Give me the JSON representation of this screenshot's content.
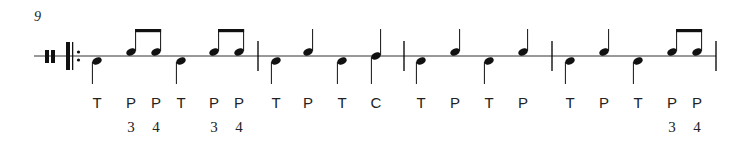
{
  "score": {
    "measure_number": "9",
    "staff_line_y": 56,
    "clef": "percussion",
    "start_repeat": true,
    "color": "#111111",
    "barlines_x": [
      258,
      404,
      552,
      716
    ],
    "notes": [
      {
        "measure": 1,
        "x": 97,
        "type": "T",
        "position": "below",
        "stem": "down",
        "beam": null,
        "label": "T",
        "fingering": ""
      },
      {
        "measure": 1,
        "x": 131,
        "type": "P",
        "position": "above",
        "stem": "up",
        "beam": "start",
        "label": "P",
        "fingering": "3"
      },
      {
        "measure": 1,
        "x": 156,
        "type": "P",
        "position": "above",
        "stem": "up",
        "beam": "end",
        "label": "P",
        "fingering": "4"
      },
      {
        "measure": 1,
        "x": 181,
        "type": "T",
        "position": "below",
        "stem": "down",
        "beam": null,
        "label": "T",
        "fingering": ""
      },
      {
        "measure": 1,
        "x": 214,
        "type": "P",
        "position": "above",
        "stem": "up",
        "beam": "start",
        "label": "P",
        "fingering": "3"
      },
      {
        "measure": 1,
        "x": 239,
        "type": "P",
        "position": "above",
        "stem": "up",
        "beam": "end",
        "label": "P",
        "fingering": "4"
      },
      {
        "measure": 2,
        "x": 276,
        "type": "T",
        "position": "below",
        "stem": "down",
        "beam": null,
        "label": "T",
        "fingering": ""
      },
      {
        "measure": 2,
        "x": 308,
        "type": "P",
        "position": "above",
        "stem": "up",
        "beam": null,
        "label": "P",
        "fingering": ""
      },
      {
        "measure": 2,
        "x": 342,
        "type": "T",
        "position": "below",
        "stem": "down",
        "beam": null,
        "label": "T",
        "fingering": ""
      },
      {
        "measure": 2,
        "x": 376,
        "type": "C",
        "position": "on",
        "stem": "both",
        "beam": null,
        "label": "C",
        "fingering": ""
      },
      {
        "measure": 3,
        "x": 421,
        "type": "T",
        "position": "below",
        "stem": "down",
        "beam": null,
        "label": "T",
        "fingering": ""
      },
      {
        "measure": 3,
        "x": 455,
        "type": "P",
        "position": "above",
        "stem": "up",
        "beam": null,
        "label": "P",
        "fingering": ""
      },
      {
        "measure": 3,
        "x": 489,
        "type": "T",
        "position": "below",
        "stem": "down",
        "beam": null,
        "label": "T",
        "fingering": ""
      },
      {
        "measure": 3,
        "x": 523,
        "type": "P",
        "position": "above",
        "stem": "up",
        "beam": null,
        "label": "P",
        "fingering": ""
      },
      {
        "measure": 4,
        "x": 570,
        "type": "T",
        "position": "below",
        "stem": "down",
        "beam": null,
        "label": "T",
        "fingering": ""
      },
      {
        "measure": 4,
        "x": 604,
        "type": "P",
        "position": "above",
        "stem": "up",
        "beam": null,
        "label": "P",
        "fingering": ""
      },
      {
        "measure": 4,
        "x": 638,
        "type": "T",
        "position": "below",
        "stem": "down",
        "beam": null,
        "label": "T",
        "fingering": ""
      },
      {
        "measure": 4,
        "x": 672,
        "type": "P",
        "position": "above",
        "stem": "up",
        "beam": "start",
        "label": "P",
        "fingering": "3"
      },
      {
        "measure": 4,
        "x": 697,
        "type": "P",
        "position": "above",
        "stem": "up",
        "beam": "end",
        "label": "P",
        "fingering": "4"
      }
    ]
  }
}
